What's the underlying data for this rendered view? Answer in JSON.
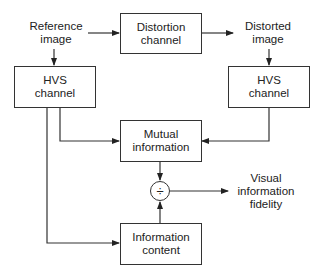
{
  "diagram": {
    "inputs": {
      "reference_image": "Reference\nimage",
      "distorted_image": "Distorted\nimage"
    },
    "boxes": {
      "distortion_channel": "Distortion\nchannel",
      "hvs_channel_left": "HVS\nchannel",
      "hvs_channel_right": "HVS\nchannel",
      "mutual_information": "Mutual\ninformation",
      "information_content": "Information\ncontent"
    },
    "operator": "÷",
    "output": "Visual\ninformation\nfidelity",
    "edges": [
      {
        "from": "reference_image",
        "to": "distortion_channel"
      },
      {
        "from": "distortion_channel",
        "to": "distorted_image"
      },
      {
        "from": "reference_image",
        "to": "hvs_channel_left"
      },
      {
        "from": "distorted_image",
        "to": "hvs_channel_right"
      },
      {
        "from": "hvs_channel_left",
        "to": "mutual_information"
      },
      {
        "from": "hvs_channel_right",
        "to": "mutual_information"
      },
      {
        "from": "hvs_channel_left",
        "to": "information_content"
      },
      {
        "from": "mutual_information",
        "to": "operator"
      },
      {
        "from": "information_content",
        "to": "operator"
      },
      {
        "from": "operator",
        "to": "output"
      }
    ]
  }
}
